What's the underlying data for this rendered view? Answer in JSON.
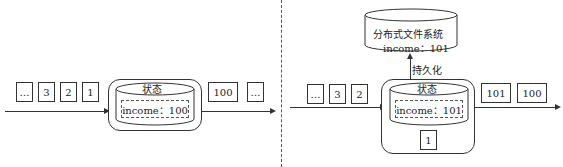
{
  "left_panel": {
    "input_events": [
      "…",
      "3",
      "2",
      "1"
    ],
    "state": {
      "title": "状态",
      "value": "income：100"
    },
    "output_events": [
      "100",
      "…"
    ]
  },
  "right_panel": {
    "input_events": [
      "…",
      "3",
      "2"
    ],
    "state": {
      "title": "状态",
      "value": "income：101",
      "processing_event": "1"
    },
    "output_events": [
      "101",
      "100"
    ],
    "storage": {
      "title": "分布式文件系统",
      "value": "income：101"
    },
    "persist_label": "持久化"
  }
}
